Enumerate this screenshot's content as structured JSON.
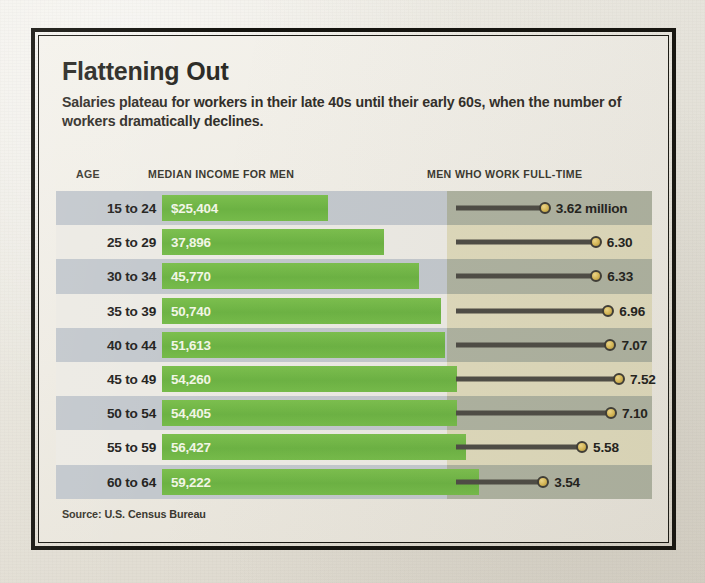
{
  "title": "Flattening Out",
  "subtitle": "Salaries plateau for workers in their late 40s until their early 60s, when the number of workers dramatically declines.",
  "headers": {
    "age": "AGE",
    "income": "MEDIAN INCOME FOR MEN",
    "fulltime": "MEN WHO WORK FULL-TIME"
  },
  "source": "Source: U.S. Census Bureau",
  "colors": {
    "bar_green": "#6cb243",
    "dot_gold": "#d8b855",
    "line_gray": "#4e4c45",
    "left_band_odd": "#c3c8cd",
    "left_band_even": "#eceae4",
    "right_band_odd": "#aeb2a0",
    "right_band_even": "#ded9bb",
    "frame_black": "#15140f",
    "paper": "#eeebe3"
  },
  "chart_data": {
    "type": "bar",
    "title": "Flattening Out",
    "subtitle": "Salaries plateau for workers in their late 40s until their early 60s, when the number of workers dramatically declines.",
    "xlabel": "",
    "ylabel": "AGE",
    "categories": [
      "15 to 24",
      "25 to 29",
      "30 to 34",
      "35 to 39",
      "40 to 44",
      "45 to 49",
      "50 to 54",
      "55 to 59",
      "60 to 64"
    ],
    "series": [
      {
        "name": "MEDIAN INCOME FOR MEN",
        "type": "bar",
        "unit": "USD",
        "values": [
          25404,
          37896,
          45770,
          50740,
          51613,
          54260,
          54405,
          56427,
          59222
        ],
        "labels": [
          "$25,404",
          "37,896",
          "45,770",
          "50,740",
          "51,613",
          "54,260",
          "54,405",
          "56,427",
          "59,222"
        ]
      },
      {
        "name": "MEN WHO WORK FULL-TIME",
        "type": "lollipop",
        "unit": "millions",
        "values": [
          3.62,
          6.3,
          6.33,
          6.96,
          7.07,
          7.52,
          7.1,
          5.58,
          3.54
        ],
        "labels": [
          "3.62 million",
          "6.30",
          "6.33",
          "6.96",
          "7.07",
          "7.52",
          "7.10",
          "5.58",
          "3.54"
        ]
      }
    ],
    "grid": false,
    "legend": "none",
    "source": "Source: U.S. Census Bureau"
  }
}
